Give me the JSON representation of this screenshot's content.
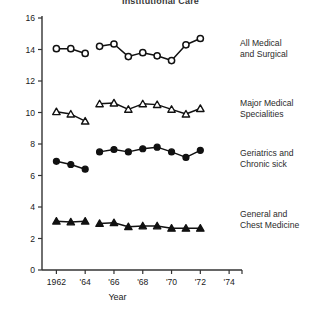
{
  "chart_data": {
    "type": "line",
    "title": "Institutional Care",
    "xlabel": "Year",
    "ylabel": "",
    "xlim": [
      1961,
      1974.2
    ],
    "ylim": [
      0,
      16
    ],
    "xticks": [
      1962,
      1964,
      1966,
      1968,
      1970,
      1972,
      1974
    ],
    "xticklabels": [
      "1962",
      "'64",
      "'66",
      "'68",
      "'70",
      "'72",
      "'74"
    ],
    "yticks": [
      0,
      2,
      4,
      6,
      8,
      10,
      12,
      14,
      16
    ],
    "yticklabels": [
      "0",
      "2",
      "4",
      "6",
      "8",
      "10",
      "12",
      "14",
      "16"
    ],
    "grid": false,
    "legend_position": "right-inline",
    "series": [
      {
        "name": "All Medical and Surgical",
        "label": "All Medical\nand Surgical",
        "marker": "open-circle",
        "segments": [
          {
            "x": [
              1962,
              1963,
              1964
            ],
            "y": [
              14.05,
              14.05,
              13.75
            ]
          },
          {
            "x": [
              1965,
              1966,
              1967,
              1968,
              1969,
              1970,
              1971,
              1972
            ],
            "y": [
              14.2,
              14.35,
              13.55,
              13.8,
              13.6,
              13.3,
              14.3,
              14.7
            ]
          }
        ]
      },
      {
        "name": "Major Medical Specialities",
        "label": "Major Medical\nSpecialities",
        "marker": "open-triangle",
        "segments": [
          {
            "x": [
              1962,
              1963,
              1964
            ],
            "y": [
              10.05,
              9.9,
              9.45
            ]
          },
          {
            "x": [
              1965,
              1966,
              1967,
              1968,
              1969,
              1970,
              1971,
              1972
            ],
            "y": [
              10.55,
              10.6,
              10.2,
              10.55,
              10.5,
              10.2,
              9.9,
              10.25
            ]
          }
        ]
      },
      {
        "name": "Geriatrics and Chronic sick",
        "label": "Geriatrics and\nChronic sick",
        "marker": "filled-circle",
        "segments": [
          {
            "x": [
              1962,
              1963,
              1964
            ],
            "y": [
              6.9,
              6.7,
              6.4
            ]
          },
          {
            "x": [
              1965,
              1966,
              1967,
              1968,
              1969,
              1970,
              1971,
              1972
            ],
            "y": [
              7.5,
              7.65,
              7.5,
              7.7,
              7.8,
              7.5,
              7.15,
              7.6
            ]
          }
        ]
      },
      {
        "name": "General and Chest Medicine",
        "label": "General and\nChest Medicine",
        "marker": "filled-triangle",
        "segments": [
          {
            "x": [
              1962,
              1963,
              1964
            ],
            "y": [
              3.1,
              3.05,
              3.1
            ]
          },
          {
            "x": [
              1965,
              1966,
              1967,
              1968,
              1969,
              1970,
              1971,
              1972
            ],
            "y": [
              2.95,
              3.0,
              2.75,
              2.8,
              2.8,
              2.65,
              2.65,
              2.65
            ]
          }
        ]
      }
    ]
  },
  "legend": {
    "items": [
      "All Medical\nand Surgical",
      "Major Medical\nSpecialities",
      "Geriatrics and\nChronic sick",
      "General and\nChest Medicine"
    ]
  }
}
